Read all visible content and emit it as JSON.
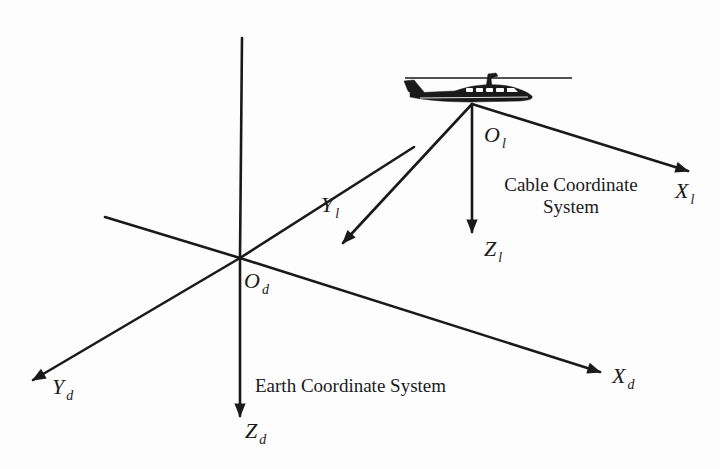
{
  "diagram": {
    "type": "coordinate-systems",
    "colors": {
      "stroke": "#1a1a1a",
      "background": "#fdfdfd"
    },
    "earth": {
      "caption": "Earth Coordinate System",
      "origin": {
        "main": "O",
        "sub": "d"
      },
      "x_axis": {
        "main": "X",
        "sub": "d"
      },
      "y_axis": {
        "main": "Y",
        "sub": "d"
      },
      "z_axis": {
        "main": "Z",
        "sub": "d"
      }
    },
    "cable": {
      "caption_line1": "Cable Coordinate",
      "caption_line2": "System",
      "origin": {
        "main": "O",
        "sub": "l"
      },
      "x_axis": {
        "main": "X",
        "sub": "l"
      },
      "y_axis": {
        "main": "Y",
        "sub": "l"
      },
      "z_axis": {
        "main": "Z",
        "sub": "l"
      }
    },
    "icons": {
      "aircraft": "helicopter-icon"
    }
  }
}
